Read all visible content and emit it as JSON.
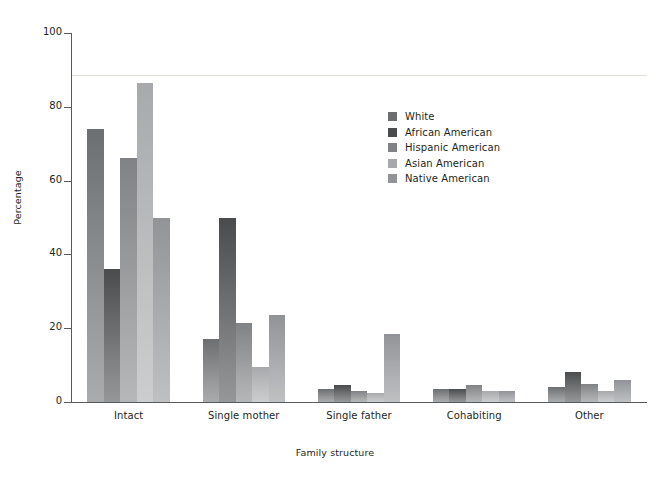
{
  "chart_data": {
    "type": "bar",
    "title": "",
    "subtitle": "",
    "xlabel": "Family structure",
    "ylabel": "Percentage",
    "categories": [
      "Intact",
      "Single mother",
      "Single father",
      "Cohabiting",
      "Other"
    ],
    "series": [
      {
        "name": "White",
        "color": "#6d6e70",
        "values": [
          74,
          17,
          3.5,
          3.5,
          4
        ]
      },
      {
        "name": "African American",
        "color": "#4a4b4d",
        "values": [
          36,
          50,
          4.5,
          3.5,
          8
        ]
      },
      {
        "name": "Hispanic American",
        "color": "#808285",
        "values": [
          66,
          21.5,
          3,
          4.5,
          5
        ]
      },
      {
        "name": "Asian American",
        "color": "#a7a9ac",
        "values": [
          86.5,
          9.5,
          2.5,
          3,
          3
        ]
      },
      {
        "name": "Native American",
        "color": "#919396",
        "values": [
          50,
          23.5,
          18.5,
          3,
          6
        ]
      }
    ],
    "ylim": [
      0,
      100
    ],
    "yticks": [
      0,
      20,
      40,
      60,
      80,
      100
    ],
    "ytick_labels": [
      "0",
      "20",
      "40",
      "60",
      "80",
      "100"
    ],
    "grid": false,
    "legend_position": "inside-upper-right",
    "axis_color": "#58595b",
    "text_color": "#231f20",
    "background": "#ffffff"
  }
}
